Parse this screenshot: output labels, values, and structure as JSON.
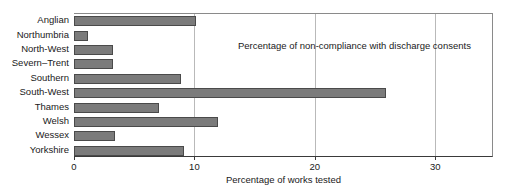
{
  "chart_data": {
    "type": "bar",
    "orientation": "horizontal",
    "title": "",
    "annotation": "Percentage of non-compliance with discharge consents",
    "xlabel": "Percentage of works tested",
    "ylabel": "",
    "xlim": [
      0,
      34.8
    ],
    "xticks": [
      0,
      10,
      20,
      30
    ],
    "xtick_labels": [
      "0",
      "10",
      "20",
      "30"
    ],
    "grid": "vertical",
    "legend": "none",
    "categories": [
      "Anglian",
      "Northumbria",
      "North-West",
      "Severn–Trent",
      "Southern",
      "South-West",
      "Thames",
      "Welsh",
      "Wessex",
      "Yorkshire"
    ],
    "values": [
      10.1,
      1.2,
      3.2,
      3.2,
      8.9,
      25.9,
      7.1,
      12.0,
      3.4,
      9.1
    ],
    "bar_color": "#7b7b7b",
    "bar_edge_color": "#4a4a4a",
    "gridline_color": "#b9b9b9",
    "axis_color": "#3a3a3a"
  }
}
